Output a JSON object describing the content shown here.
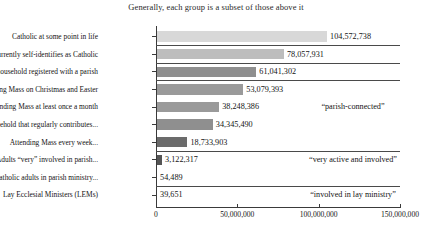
{
  "chart_data": {
    "type": "bar",
    "orientation": "horizontal",
    "title": "Generally, each group is a subset of those above it",
    "xlabel": "",
    "ylabel": "",
    "xlim": [
      0,
      150000000
    ],
    "grid": false,
    "legend": "none",
    "xticks": [
      {
        "value": 0,
        "label": "0"
      },
      {
        "value": 50000000,
        "label": "50,000,000"
      },
      {
        "value": 100000000,
        "label": "100,000,000"
      },
      {
        "value": 150000000,
        "label": "150,000,000"
      }
    ],
    "categories": [
      "Catholic at some point in life",
      "Currently self-identifies as Catholic",
      "In a household registered with a parish",
      "Attending Mass on Christmas and Easter",
      "Attending Mass at least once a month",
      "In a household that regularly contributes...",
      "Attending Mass every week...",
      "Adults “very” involved in parish...",
      "Lay Catholic adults in parish ministry...",
      "Lay Ecclesial Ministers (LEMs)"
    ],
    "values": [
      104572738,
      78057931,
      61041302,
      53079393,
      38248386,
      34345490,
      18733903,
      3122317,
      54489,
      39651
    ],
    "value_labels": [
      "104,572,738",
      "78,057,931",
      "61,041,302",
      "53,079,393",
      "38,248,386",
      "34,345,490",
      "18,733,903",
      "3,122,317",
      "54,489",
      "39,651"
    ],
    "bar_colors": [
      "#d8d8d8",
      "#bdbdbd",
      "#8f8f8f",
      "#9a9a9a",
      "#9a9a9a",
      "#8f8f8f",
      "#6b6b6b",
      "#555555",
      "#555555",
      "#555555"
    ],
    "annotations": [
      {
        "text": "“parish-connected”"
      },
      {
        "text": "“very active and involved”"
      },
      {
        "text": "“involved in lay ministry”"
      }
    ],
    "separators_after_rows": [
      1,
      2,
      3,
      7,
      9
    ]
  }
}
